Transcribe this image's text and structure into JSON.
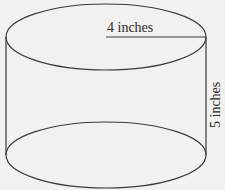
{
  "diagram": {
    "shape": "cylinder",
    "radius_label": "4 inches",
    "height_label": "5 inches",
    "colors": {
      "background": "#f1f1f0",
      "stroke": "#3a3a3a",
      "text": "#2a2a2a"
    }
  }
}
